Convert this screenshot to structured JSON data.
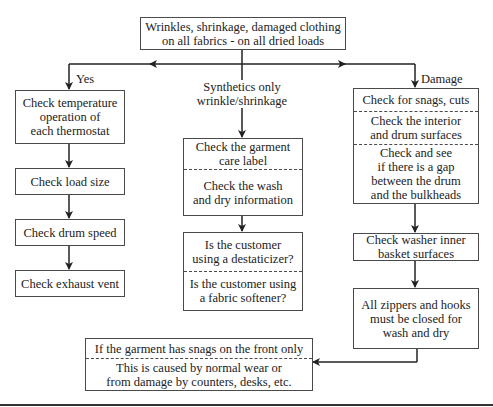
{
  "diagram": {
    "root": {
      "text": "Wrinkles, shrinkage, damaged clothing\non all fabrics - on all dried loads"
    },
    "branches": {
      "yes": {
        "label": "Yes",
        "steps": [
          "Check temperature\noperation of\neach thermostat",
          "Check load size",
          "Check drum speed",
          "Check exhaust vent"
        ]
      },
      "synthetics": {
        "label": "Synthetics only\nwrinkle/shrinkage",
        "box1": [
          "Check the garment\ncare label",
          "Check the wash\nand dry information"
        ],
        "box2": [
          "Is the customer\nusing a destaticizer?",
          "Is the customer using\na fabric softener?"
        ]
      },
      "damage": {
        "label": "Damage",
        "box1": [
          "Check for snags, cuts",
          "Check the interior\nand drum surfaces",
          "Check and see\nif there is a gap\nbetween the drum\nand the bulkheads"
        ],
        "box2": "Check washer inner\nbasket surfaces",
        "box3": "All zippers and hooks\nmust be closed for\nwash and dry"
      }
    },
    "final": {
      "sections": [
        "If the garment has snags on the front only",
        "This is caused by normal wear or\nfrom damage by counters, desks, etc."
      ]
    },
    "colors": {
      "line": "#222222",
      "border": "#4a4a4a",
      "background": "#ffffff"
    }
  }
}
